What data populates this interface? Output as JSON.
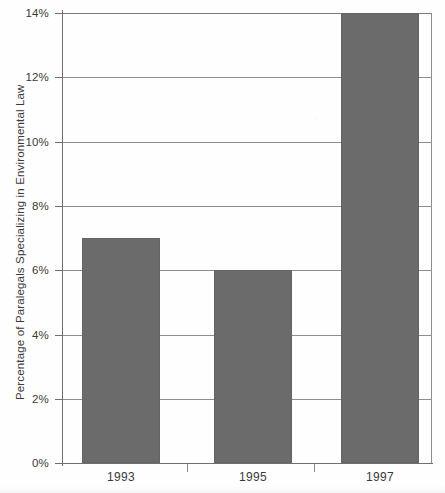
{
  "chart_data": {
    "type": "bar",
    "title": "",
    "xlabel": "",
    "ylabel": "Percentage of Paralegals Specializing in Environmental Law",
    "categories": [
      "1993",
      "1995",
      "1997"
    ],
    "values": [
      7,
      6,
      14
    ],
    "ylim": [
      0,
      14
    ],
    "yticks": [
      "0%",
      "2%",
      "4%",
      "6%",
      "8%",
      "10%",
      "12%",
      "14%"
    ],
    "ytick_values": [
      0,
      2,
      4,
      6,
      8,
      10,
      12,
      14
    ],
    "grid": true,
    "legend": "none",
    "series": [
      {
        "name": "Percentage of Paralegals Specializing in Environmental Law",
        "values": [
          7,
          6,
          14
        ],
        "color": "#6b6b6b"
      }
    ],
    "bar_color": "#6b6b6b",
    "axis_color": "#6f6f6f",
    "gridline_color": "#8d8d8d",
    "background_color": "#ffffff"
  }
}
